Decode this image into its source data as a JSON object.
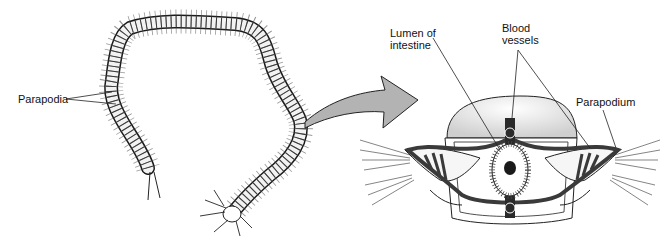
{
  "figure": {
    "left_panel": {
      "subject": "whole-worm",
      "labels": [
        {
          "id": "parapodia",
          "text": "Parapodia"
        }
      ]
    },
    "arrow": {
      "color": "#b3b3b3",
      "direction": "left-to-right"
    },
    "right_panel": {
      "subject": "cross-section",
      "labels": [
        {
          "id": "lumen",
          "text": "Lumen of\nintestine"
        },
        {
          "id": "blood",
          "text": "Blood\nvessels"
        },
        {
          "id": "parapodium",
          "text": "Parapodium"
        }
      ]
    },
    "colors": {
      "ink": "#1a1a1a",
      "vessel": "#3a3a3a",
      "shade": "#cfcfcf",
      "arrow_fill": "#b3b3b3",
      "background": "#ffffff"
    }
  }
}
